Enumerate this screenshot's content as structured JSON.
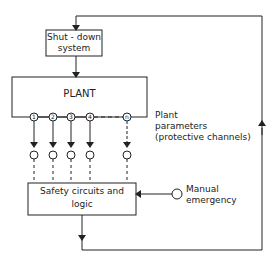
{
  "diagram": {
    "type": "block-diagram",
    "shutdown_box": {
      "line1": "Shut - down",
      "line2": "system"
    },
    "plant_box": {
      "label": "PLANT"
    },
    "channels": [
      "1",
      "2",
      "3",
      "4",
      "n"
    ],
    "plant_parameters": {
      "line1": "Plant",
      "line2": "parameters",
      "line3": "(protective channels)"
    },
    "safety_box": {
      "line1": "Safety circuits and",
      "line2": "logic"
    },
    "manual": {
      "line1": "Manual",
      "line2": "emergency"
    }
  }
}
